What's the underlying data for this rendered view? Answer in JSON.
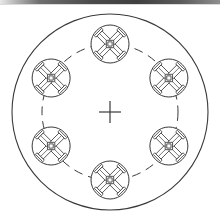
{
  "document": {
    "title": "Rotary Fixture Plate Assembly",
    "kind": "engineering-line-drawing",
    "view": "plan view",
    "background_color": "#ffffff",
    "line_color": "#3a3a3a"
  },
  "canvas": {
    "width": 220,
    "height": 224
  },
  "scan_artifact": {
    "present": true,
    "label": "scanned edge band",
    "position": "top",
    "height": 4,
    "color": "#4a4a4a"
  },
  "geometry": {
    "center": {
      "x": 110,
      "y": 112
    },
    "outer_circle": {
      "label": "plate outer diameter",
      "radius": 98,
      "stroke_width": 1.1,
      "style": "solid"
    },
    "bolt_circle": {
      "label": "fixture pitch circle",
      "radius": 68,
      "stroke_width": 1,
      "style": "dashed",
      "dash_pattern": "9 6"
    },
    "center_mark": {
      "label": "center crosshair",
      "arm_length": 11,
      "stroke_width": 1.2
    }
  },
  "fixtures": {
    "count": 6,
    "angular_pitch_deg": 60,
    "start_angle_deg": -90,
    "body": {
      "label": "fixture boss circle",
      "radius": 19,
      "stroke_width": 1
    },
    "cross": {
      "label": "four-arm clamp cross",
      "rotation_deg": 45,
      "arm_length": 17,
      "arm_half_width": 3.6,
      "arm_tip_cap_width": 2.2,
      "hub_radius": 5.2,
      "hub_inner_radius": 3.0,
      "stroke_width": 0.8
    },
    "items": [
      {
        "id": "fixture-1",
        "position_label": "top",
        "angle_deg": -90
      },
      {
        "id": "fixture-2",
        "position_label": "upper-right",
        "angle_deg": -30
      },
      {
        "id": "fixture-3",
        "position_label": "lower-right",
        "angle_deg": 30
      },
      {
        "id": "fixture-4",
        "position_label": "bottom",
        "angle_deg": 90
      },
      {
        "id": "fixture-5",
        "position_label": "lower-left",
        "angle_deg": 150
      },
      {
        "id": "fixture-6",
        "position_label": "upper-left",
        "angle_deg": 210
      }
    ]
  }
}
